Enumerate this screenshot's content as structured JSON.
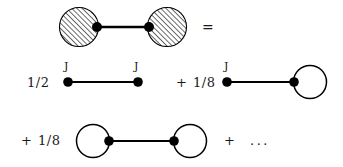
{
  "figure": {
    "type": "feynman-diagram-expansion",
    "background_color": "#ffffff",
    "ink_color": "#000000"
  },
  "rows": {
    "row1": {
      "equals_sign": "=",
      "blob_left": "hatched-blob",
      "blob_right": "hatched-blob",
      "propagator": "straight-line"
    },
    "row2": {
      "term1_coefficient": "1/2",
      "term1_vertex_label_left": "J",
      "term1_vertex_label_right": "J",
      "plus_sign": "+",
      "term2_coefficient": "1/8",
      "term2_vertex_label": "J"
    },
    "row3": {
      "term3_plus": "+",
      "term3_coefficient": "1/8",
      "trailing_plus": "+",
      "ellipsis": "..."
    }
  },
  "geometry": {
    "row1": {
      "blob_left": {
        "cx": 79,
        "cy": 27,
        "r": 19
      },
      "blob_right": {
        "cx": 167,
        "cy": 27,
        "r": 19
      },
      "dot_left": {
        "cx": 97,
        "cy": 27,
        "r": 4.5
      },
      "dot_right": {
        "cx": 149,
        "cy": 27,
        "r": 4.5
      },
      "line": {
        "x1": 97,
        "y1": 27,
        "x2": 149,
        "y2": 27
      },
      "equals": {
        "x": 202,
        "y": 19
      }
    },
    "row2": {
      "coefficient1": {
        "x": 27,
        "y": 76
      },
      "dot_left": {
        "cx": 68,
        "cy": 82,
        "r": 4.5
      },
      "dot_right": {
        "cx": 138,
        "cy": 82,
        "r": 4.5
      },
      "line": {
        "x1": 68,
        "y1": 82,
        "x2": 138,
        "y2": 82
      },
      "label_J_left": {
        "x": 64,
        "y": 61
      },
      "label_J_right": {
        "x": 134,
        "y": 61
      },
      "plus": {
        "x": 176,
        "y": 76
      },
      "coefficient2": {
        "x": 193,
        "y": 76
      },
      "dot2": {
        "cx": 227,
        "cy": 82,
        "r": 4.5
      },
      "line2": {
        "x1": 227,
        "y1": 82,
        "x2": 293,
        "y2": 82
      },
      "loop": {
        "cx": 309,
        "cy": 82,
        "r": 16
      },
      "dot_loop": {
        "cx": 293,
        "cy": 82,
        "r": 4.5
      },
      "label_J2": {
        "x": 224,
        "y": 61
      }
    },
    "row3": {
      "plus": {
        "x": 21,
        "y": 134
      },
      "coefficient": {
        "x": 38,
        "y": 134
      },
      "loop_left": {
        "cx": 93,
        "cy": 141,
        "r": 16
      },
      "dot_left": {
        "cx": 109,
        "cy": 141,
        "r": 4.5
      },
      "line": {
        "x1": 109,
        "y1": 141,
        "x2": 174,
        "y2": 141
      },
      "dot_right": {
        "cx": 174,
        "cy": 141,
        "r": 4.5
      },
      "loop_right": {
        "cx": 190,
        "cy": 141,
        "r": 16
      },
      "plus2": {
        "x": 224,
        "y": 134
      },
      "ellipsis": {
        "x": 250,
        "y": 133
      }
    }
  },
  "style": {
    "line_width": 2,
    "circle_stroke_width": 1.4,
    "hatch_angle_deg": 45,
    "hatch_spacing_px": 2.6,
    "hatch_stroke_width": 1.1
  }
}
